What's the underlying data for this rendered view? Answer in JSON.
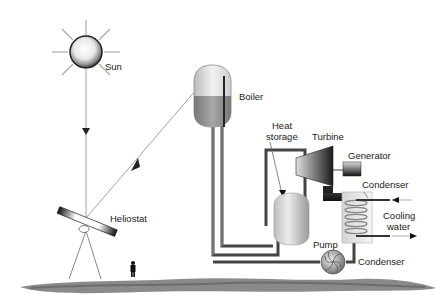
{
  "diagram": {
    "labels": {
      "sun": "Sun",
      "boiler": "Boiler",
      "heat_storage_line1": "Heat",
      "heat_storage_line2": "storage",
      "turbine": "Turbine",
      "generator": "Generator",
      "condenser_top": "Condenser",
      "cooling_water_line1": "Cooling",
      "cooling_water_line2": "water",
      "pump": "Pump",
      "condenser_bottom": "Condenser",
      "heliostat": "Heliostat"
    },
    "colors": {
      "line": "#888888",
      "pipe": "#555555",
      "ground": "#8a8a8a",
      "boiler_liquid": "#9a9a9a",
      "background": "#ffffff"
    },
    "components": [
      "Sun",
      "Heliostat",
      "Boiler",
      "Heat storage",
      "Turbine",
      "Generator",
      "Condenser",
      "Pump",
      "Cooling water"
    ]
  }
}
